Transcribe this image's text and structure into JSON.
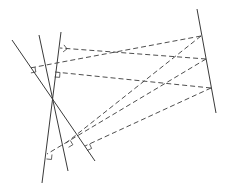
{
  "diagram": {
    "stroke_color": "#3a3a3a",
    "background": "#ffffff",
    "concurrency_point": [
      52,
      100
    ],
    "solid_lines": [
      {
        "name": "line-left",
        "x1": 12,
        "y1": 40,
        "x2": 95,
        "y2": 161
      },
      {
        "name": "line-middle",
        "x1": 39,
        "y1": 35,
        "x2": 68,
        "y2": 171
      },
      {
        "name": "line-right",
        "x1": 61,
        "y1": 32,
        "x2": 42,
        "y2": 183
      },
      {
        "name": "line-far-right",
        "x1": 197,
        "y1": 9,
        "x2": 216,
        "y2": 113
      }
    ],
    "dashed_lines": [
      {
        "x1": 201,
        "y1": 36,
        "x2": 30,
        "y2": 68
      },
      {
        "x1": 201,
        "y1": 36,
        "x2": 66,
        "y2": 143
      },
      {
        "x1": 206,
        "y1": 59,
        "x2": 60,
        "y2": 48
      },
      {
        "x1": 206,
        "y1": 59,
        "x2": 47,
        "y2": 154
      },
      {
        "x1": 211,
        "y1": 88,
        "x2": 55,
        "y2": 72
      },
      {
        "x1": 211,
        "y1": 88,
        "x2": 85,
        "y2": 146
      }
    ],
    "right_angle_markers": [
      {
        "x": 30,
        "y": 68
      },
      {
        "x": 60,
        "y": 48
      },
      {
        "x": 55,
        "y": 72
      },
      {
        "x": 66,
        "y": 143
      },
      {
        "x": 47,
        "y": 154
      },
      {
        "x": 85,
        "y": 146
      }
    ]
  }
}
